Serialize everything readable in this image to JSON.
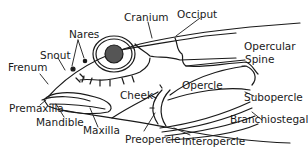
{
  "diagram": {
    "labels": {
      "cranium": "Cranium",
      "occiput": "Occiput",
      "nares": "Nares",
      "snout": "Snout",
      "frenum": "Frenum",
      "opercular_spine_1": "Opercular",
      "opercular_spine_2": "Spine",
      "opercle": "Opercle",
      "cheek": "Cheek",
      "subopercle": "Subopercle",
      "premaxilla": "Premaxilla",
      "mandible": "Mandible",
      "maxilla": "Maxilla",
      "branchiostegals": "Branchiostegals",
      "preopercle": "Preopercle",
      "interopercle": "Interopercle"
    }
  }
}
